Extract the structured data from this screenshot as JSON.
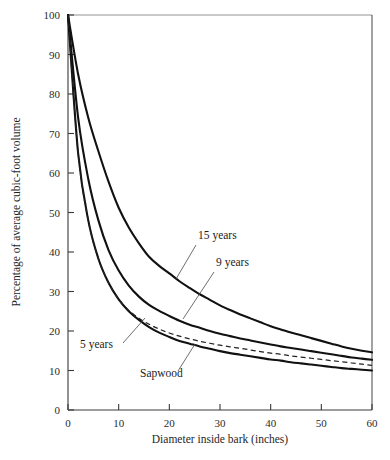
{
  "chart_data": {
    "type": "line",
    "title": "",
    "subtitle": "",
    "xlabel": "Diameter inside bark (inches)",
    "ylabel": "Percentage of average cubic-foot volume",
    "xlim": [
      0,
      60
    ],
    "ylim": [
      0,
      100
    ],
    "xticks": [
      0,
      10,
      20,
      30,
      40,
      50,
      60
    ],
    "yticks": [
      0,
      10,
      20,
      30,
      40,
      50,
      60,
      70,
      80,
      90,
      100
    ],
    "xtick_labels": [
      "0",
      "10",
      "20",
      "30",
      "40",
      "50",
      "60"
    ],
    "ytick_labels": [
      "0",
      "10",
      "20",
      "30",
      "40",
      "50",
      "60",
      "70",
      "80",
      "90",
      "100"
    ],
    "grid": false,
    "legend": "inline-annotations",
    "x": [
      0,
      2,
      4,
      6,
      8,
      10,
      12,
      14,
      16,
      18,
      20,
      22,
      24,
      26,
      28,
      30,
      32,
      34,
      36,
      38,
      40,
      42,
      44,
      46,
      48,
      50,
      52,
      54,
      56,
      58,
      60
    ],
    "series": [
      {
        "name": "15 years",
        "style": "solid",
        "color": "#111111",
        "values": [
          100,
          85.0,
          74.0,
          65.5,
          57.8,
          51.2,
          46.2,
          42.2,
          38.8,
          36.5,
          34.6,
          32.6,
          30.9,
          29.3,
          27.9,
          26.5,
          25.3,
          24.2,
          23.2,
          22.2,
          21.2,
          20.4,
          19.6,
          18.9,
          18.2,
          17.5,
          16.8,
          16.1,
          15.5,
          15.0,
          14.6
        ]
      },
      {
        "name": "9 years",
        "style": "solid",
        "color": "#111111",
        "values": [
          100,
          74.0,
          58.5,
          48.0,
          40.5,
          35.3,
          31.5,
          28.7,
          26.6,
          25.1,
          23.8,
          22.6,
          21.6,
          20.8,
          20.0,
          19.3,
          18.7,
          18.1,
          17.6,
          17.1,
          16.6,
          16.1,
          15.7,
          15.3,
          14.9,
          14.5,
          14.1,
          13.7,
          13.3,
          13.0,
          12.7
        ]
      },
      {
        "name": "5 years",
        "style": "solid",
        "color": "#111111",
        "values": [
          100,
          65.0,
          48.0,
          38.3,
          32.2,
          28.0,
          25.0,
          22.8,
          21.0,
          19.6,
          18.5,
          17.5,
          16.8,
          16.1,
          15.5,
          14.9,
          14.4,
          14.0,
          13.6,
          13.2,
          12.8,
          12.5,
          12.1,
          11.8,
          11.5,
          11.2,
          10.9,
          10.6,
          10.4,
          10.2,
          10.0
        ]
      },
      {
        "name": "Sapwood",
        "style": "dashed",
        "color": "#222222",
        "values": [
          100,
          65.0,
          48.0,
          38.3,
          32.2,
          28.0,
          25.2,
          23.2,
          21.7,
          20.5,
          19.5,
          18.7,
          18.0,
          17.4,
          16.9,
          16.4,
          16.0,
          15.6,
          15.2,
          14.8,
          14.4,
          14.1,
          13.7,
          13.4,
          13.1,
          12.8,
          12.5,
          12.2,
          11.9,
          11.6,
          11.3
        ]
      }
    ],
    "annotations": [
      {
        "label": "15 years",
        "text_x": 198,
        "text_y": 239,
        "leader_from_x": 196,
        "leader_from_y": 245,
        "leader_to_x": 176,
        "leader_to_y": 279
      },
      {
        "label": "9 years",
        "text_x": 216,
        "text_y": 266,
        "leader_from_x": 214,
        "leader_from_y": 272,
        "leader_to_x": 183,
        "leader_to_y": 319
      },
      {
        "label": "5 years",
        "text_x": 80,
        "text_y": 348,
        "leader_from_x": 123,
        "leader_from_y": 343,
        "leader_to_x": 145,
        "leader_to_y": 318
      },
      {
        "label": "Sapwood",
        "text_x": 140,
        "text_y": 377,
        "leader_from_x": 178,
        "leader_from_y": 371,
        "leader_to_x": 195,
        "leader_to_y": 344
      }
    ]
  },
  "plot": {
    "left_px": 68,
    "right_px": 372,
    "top_px": 15,
    "bottom_px": 410
  }
}
